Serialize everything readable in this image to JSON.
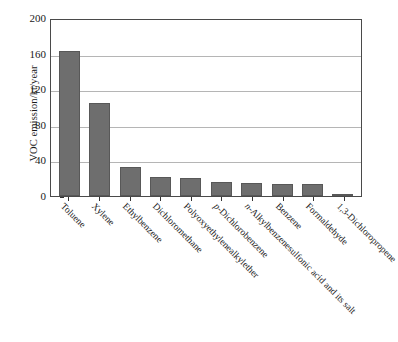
{
  "chart_data": {
    "type": "bar",
    "title": "",
    "xlabel": "",
    "ylabel": "VOC emission/kt/year",
    "ylim": [
      0,
      200
    ],
    "yticks": [
      0,
      40,
      80,
      120,
      160,
      200
    ],
    "grid": true,
    "legend": "none",
    "bar_color": "#6e6e6e",
    "categories": [
      "Toluene",
      "Xylene",
      "Ethylbenzene",
      "Dichloromethane",
      "Polyoxyethylenealkylether",
      "p-Dichlorobenzene",
      "n-Alkylbenzenesulfonic acid and its salt",
      "Benzene",
      "Formaldehyde",
      "1,3-Dichloropropene"
    ],
    "category_italic_prefix": [
      "",
      "",
      "",
      "",
      "",
      "p-",
      "n-",
      "",
      "",
      ""
    ],
    "values": [
      163,
      104,
      33,
      21,
      20,
      16,
      15,
      14,
      13,
      1
    ]
  },
  "axes": {
    "y_title": "VOC emission/kt/year",
    "y_tick_labels": [
      "200",
      "160",
      "120",
      "80",
      "40",
      "0"
    ]
  }
}
